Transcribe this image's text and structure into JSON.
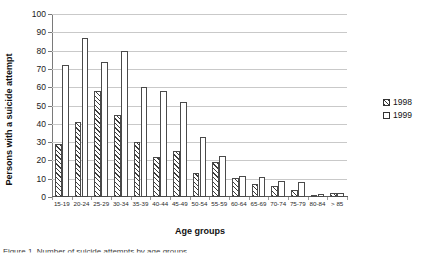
{
  "chart_data": {
    "type": "bar",
    "title": "",
    "xlabel": "Age groups",
    "ylabel": "Persons with a suicide attempt",
    "ylim": [
      0,
      100
    ],
    "ytick_step": 10,
    "yticks": [
      "0",
      "10",
      "20",
      "30",
      "40",
      "50",
      "60",
      "70",
      "80",
      "90",
      "100"
    ],
    "grid": true,
    "legend_position": "right",
    "categories": [
      "15-19",
      "20-24",
      "25-29",
      "30-34",
      "35-39",
      "40-44",
      "45-49",
      "50-54",
      "55-59",
      "60-64",
      "65-69",
      "70-74",
      "75-79",
      "80-84",
      "> 85"
    ],
    "series": [
      {
        "name": "1998",
        "fill": "hatched",
        "values": [
          29,
          41,
          58,
          45,
          30,
          22,
          25,
          13,
          19,
          10.5,
          7,
          6,
          4,
          1,
          2
        ]
      },
      {
        "name": "1999",
        "fill": "open",
        "values": [
          72,
          87,
          74,
          80,
          60,
          58,
          52,
          33,
          22.5,
          11.5,
          11,
          9,
          8,
          1.5,
          2
        ]
      }
    ]
  },
  "legend": {
    "entries": [
      {
        "label": "1998"
      },
      {
        "label": "1999"
      }
    ]
  },
  "caption": {
    "text": "Figure 1. Number of suicide attempts by age groups"
  }
}
